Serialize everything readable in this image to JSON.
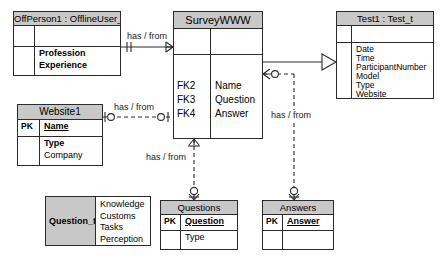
{
  "diagram": {
    "colors": {
      "header_fill": "#c8c8c8",
      "body_fill": "#ffffff",
      "line": "#2b2b2b"
    },
    "entities": [
      {
        "id": "offperson",
        "name": "OffPerson1 : OfflineUser_t",
        "key_rows": [],
        "attributes": [
          "Profession",
          "Experience"
        ]
      },
      {
        "id": "website",
        "name": "Website1",
        "pk_label": "PK",
        "pk_attr": "Name",
        "attributes": [
          "Type",
          "Company"
        ]
      },
      {
        "id": "survey",
        "name": "SurveyWWW",
        "fk_labels": [
          "FK2",
          "FK3",
          "FK4"
        ],
        "fk_attrs": [
          "Name",
          "Question",
          "Answer"
        ]
      },
      {
        "id": "test",
        "name": "Test1 : Test_t",
        "attributes": [
          "Date",
          "Time",
          "ParticipantNumber",
          "Model",
          "Type",
          "Website"
        ]
      },
      {
        "id": "questiont",
        "name": "Question_t",
        "attributes": [
          "Knowledge",
          "Customs",
          "Tasks",
          "Perception"
        ]
      },
      {
        "id": "questions",
        "name": "Questions",
        "pk_label": "PK",
        "pk_attr": "Question",
        "attributes": [
          "Type"
        ]
      },
      {
        "id": "answers",
        "name": "Answers",
        "pk_label": "PK",
        "pk_attr": "Answer",
        "attributes": [
          ""
        ]
      }
    ],
    "relationships": [
      {
        "id": "offperson-survey",
        "label": "has / from"
      },
      {
        "id": "website-survey",
        "label": "has / from"
      },
      {
        "id": "survey-test",
        "label": "has / from"
      },
      {
        "id": "survey-questions",
        "label": "has / from"
      }
    ]
  }
}
